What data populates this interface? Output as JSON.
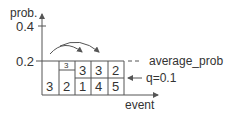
{
  "diagram": {
    "y_axis_label": "prob.",
    "y_ticks": [
      "0.4",
      "0.2"
    ],
    "x_axis_label": "event",
    "average_label": "average_prob",
    "q_label": "q=0.1",
    "columns": [
      {
        "bottom": "3"
      },
      {
        "top": "3",
        "bottom": "2"
      },
      {
        "top": "3",
        "bottom": "1"
      },
      {
        "top": "3",
        "bottom": "4"
      },
      {
        "top": "2",
        "bottom": "5"
      }
    ],
    "colors": {
      "line": "#555555",
      "text": "#333333"
    }
  }
}
